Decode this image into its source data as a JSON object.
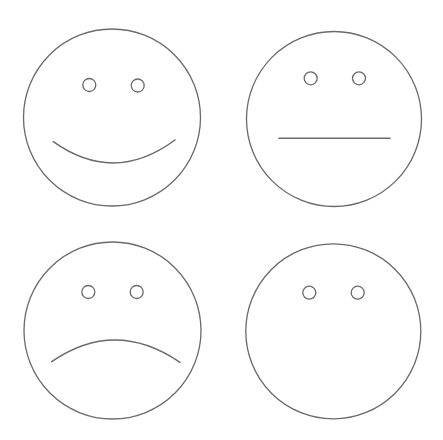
{
  "canvas": {
    "width": 443,
    "height": 440,
    "background": "#ffffff",
    "stroke_color": "#6a6a6a"
  },
  "faces": [
    {
      "id": "happy",
      "expression": "happy",
      "head": {
        "cx": 112,
        "cy": 117.5,
        "r": 88.5
      },
      "eyes": [
        {
          "cx": 89.3,
          "cy": 85,
          "r": 6.5
        },
        {
          "cx": 137.7,
          "cy": 85.5,
          "r": 6.5
        }
      ],
      "mouth": {
        "type": "smile",
        "path": "M 53.3 141.7 Q 114 185 175 140"
      }
    },
    {
      "id": "neutral",
      "expression": "neutral",
      "head": {
        "cx": 334,
        "cy": 119,
        "r": 87.5
      },
      "eyes": [
        {
          "cx": 310.7,
          "cy": 78.3,
          "r": 6.5
        },
        {
          "cx": 359,
          "cy": 78.3,
          "r": 6.5
        }
      ],
      "mouth": {
        "type": "straight",
        "path": "M 279 138.3 L 390 138.3"
      }
    },
    {
      "id": "sad",
      "expression": "sad",
      "head": {
        "cx": 112.5,
        "cy": 330.5,
        "r": 88.5
      },
      "eyes": [
        {
          "cx": 88.3,
          "cy": 292,
          "r": 6.5
        },
        {
          "cx": 136.7,
          "cy": 292,
          "r": 6.5
        }
      ],
      "mouth": {
        "type": "frown",
        "path": "M 51.7 361.7 Q 115 318 180 362.3"
      }
    },
    {
      "id": "blank",
      "expression": "no-mouth",
      "head": {
        "cx": 333.3,
        "cy": 331.3,
        "r": 87.5
      },
      "eyes": [
        {
          "cx": 309.3,
          "cy": 292.7,
          "r": 6.5
        },
        {
          "cx": 357.7,
          "cy": 292.7,
          "r": 6.5
        }
      ],
      "mouth": null
    }
  ]
}
